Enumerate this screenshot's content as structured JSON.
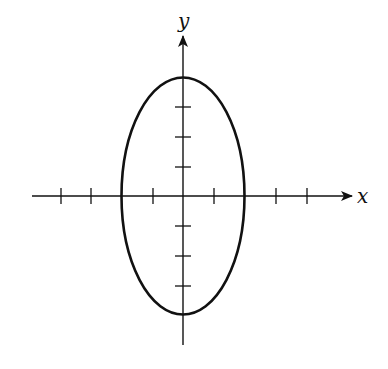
{
  "figure": {
    "title": "",
    "type": "ellipse-on-axes",
    "axes": {
      "x_label": "x",
      "y_label": "y",
      "origin_px": [
        183,
        196
      ],
      "unit_px": 30.3,
      "x_ticks": [
        -4,
        -3,
        -1,
        1,
        3,
        4
      ],
      "y_ticks": [
        -3,
        -2,
        -1,
        1,
        2,
        3
      ],
      "x_range_units": [
        -5,
        5.5
      ],
      "y_range_units": [
        -5,
        5.3
      ]
    },
    "ellipse": {
      "equation": "x^2/4 + y^2/16 = 1",
      "center": [
        0,
        0
      ],
      "semi_axis_x": 2,
      "semi_axis_y": 4
    },
    "colors": {
      "stroke": "#111111",
      "background": "#ffffff"
    }
  }
}
